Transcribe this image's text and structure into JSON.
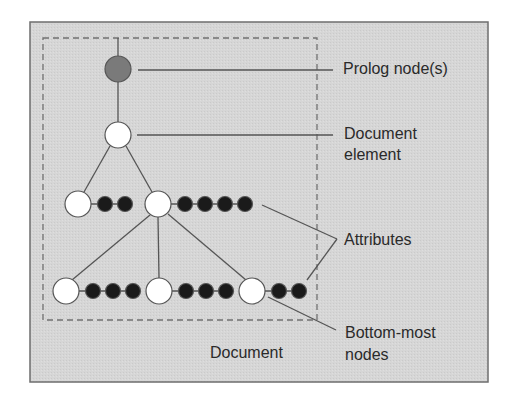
{
  "diagram": {
    "colors": {
      "panel_bg": "#d6d6d6",
      "panel_border": "#6e6e6e",
      "dashed_border": "#707070",
      "line": "#555555",
      "prolog_node": "#7a7a7a",
      "element_node": "#ffffff",
      "attribute_node": "#1a1a1a",
      "text": "#2a2a2a"
    },
    "labels": {
      "prolog": "Prolog node(s)",
      "document_element_line1": "Document",
      "document_element_line2": "element",
      "attributes": "Attributes",
      "bottom_line1": "Bottom-most",
      "bottom_line2": "nodes",
      "document": "Document"
    },
    "nodes": {
      "prolog": {
        "x": 118,
        "y": 69,
        "type": "prolog"
      },
      "document_element": {
        "x": 118,
        "y": 135,
        "type": "element"
      },
      "level2": [
        {
          "x": 78,
          "y": 204,
          "attributes": 2
        },
        {
          "x": 158,
          "y": 204,
          "attributes": 4
        }
      ],
      "level3": [
        {
          "x": 66,
          "y": 291,
          "attributes": 3
        },
        {
          "x": 159,
          "y": 291,
          "attributes": 3
        },
        {
          "x": 252,
          "y": 291,
          "attributes": 2
        }
      ]
    }
  }
}
